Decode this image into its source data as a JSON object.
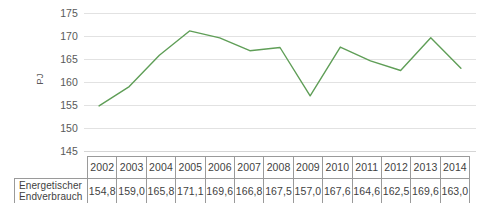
{
  "chart_data": {
    "type": "line",
    "title": "",
    "subtitle": "",
    "xlabel": "",
    "ylabel": "PJ",
    "ylim": [
      145,
      175
    ],
    "y_ticks": [
      145,
      150,
      155,
      160,
      165,
      170,
      175
    ],
    "y_tick_labels": [
      "145",
      "150",
      "155",
      "160",
      "165",
      "170",
      "175"
    ],
    "grid": true,
    "legend": "none",
    "series_color": "#5f9e57",
    "categories": [
      "2002",
      "2003",
      "2004",
      "2005",
      "2006",
      "2007",
      "2008",
      "2009",
      "2010",
      "2011",
      "2012",
      "2013",
      "2014"
    ],
    "series": [
      {
        "name": "Energetischer Endverbrauch",
        "values": [
          154.8,
          159.0,
          165.8,
          171.1,
          169.6,
          166.8,
          167.5,
          157.0,
          167.6,
          164.6,
          162.5,
          169.6,
          163.0
        ],
        "value_labels": [
          "154,8",
          "159,0",
          "165,8",
          "171,1",
          "169,6",
          "166,8",
          "167,5",
          "157,0",
          "167,6",
          "164,6",
          "162,5",
          "169,6",
          "163,0"
        ]
      }
    ]
  },
  "axis": {
    "y_title": "PJ",
    "ticks": [
      "175",
      "170",
      "165",
      "160",
      "155",
      "150",
      "145"
    ]
  },
  "table": {
    "corner_label": "",
    "row_header_line1": "Energetischer",
    "row_header_line2": "Endverbrauch",
    "years": [
      "2002",
      "2003",
      "2004",
      "2005",
      "2006",
      "2007",
      "2008",
      "2009",
      "2010",
      "2011",
      "2012",
      "2013",
      "2014"
    ],
    "values": [
      "154,8",
      "159,0",
      "165,8",
      "171,1",
      "169,6",
      "166,8",
      "167,5",
      "157,0",
      "167,6",
      "164,6",
      "162,5",
      "169,6",
      "163,0"
    ]
  },
  "colors": {
    "line": "#5f9e57",
    "grid": "#e2e2e2",
    "table_border": "#9a9a9a",
    "text": "#3f3f3f",
    "tick_text": "#595959"
  }
}
